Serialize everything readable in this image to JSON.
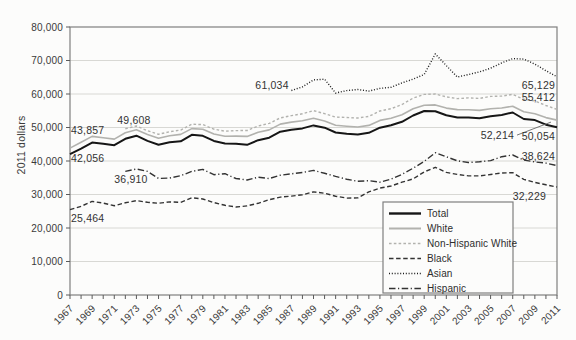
{
  "chart_data": {
    "type": "line",
    "title": "",
    "xlabel": "",
    "ylabel": "2011 dollars",
    "ylim": [
      0,
      80000
    ],
    "ytick_labels": [
      "0",
      "10,000",
      "20,000",
      "30,000",
      "40,000",
      "50,000",
      "60,000",
      "70,000",
      "80,000"
    ],
    "x": [
      1967,
      1968,
      1969,
      1970,
      1971,
      1972,
      1973,
      1974,
      1975,
      1976,
      1977,
      1978,
      1979,
      1980,
      1981,
      1982,
      1983,
      1984,
      1985,
      1986,
      1987,
      1988,
      1989,
      1990,
      1991,
      1992,
      1993,
      1994,
      1995,
      1996,
      1997,
      1998,
      1999,
      2000,
      2001,
      2002,
      2003,
      2004,
      2005,
      2006,
      2007,
      2008,
      2009,
      2010,
      2011
    ],
    "xtick_labels": [
      "1967",
      "1969",
      "1971",
      "1973",
      "1975",
      "1977",
      "1979",
      "1981",
      "1983",
      "1985",
      "1987",
      "1989",
      "1991",
      "1993",
      "1995",
      "1997",
      "1999",
      "2001",
      "2003",
      "2005",
      "2007",
      "2009",
      "2011"
    ],
    "grid": "horizontal",
    "grid_color": "#d8d8d4",
    "frame_color": "#7f7f7f",
    "tick_color": "#5a5a5a",
    "legend_position": "inside-bottom-right",
    "series": [
      {
        "name": "Total",
        "color": "#161616",
        "width": 2,
        "dash": "",
        "values": [
          42056,
          43700,
          45499,
          45146,
          44707,
          46622,
          47563,
          45989,
          44851,
          45595,
          45884,
          47813,
          47527,
          45989,
          45260,
          45139,
          44823,
          46215,
          46945,
          48746,
          49358,
          49737,
          50624,
          49950,
          48516,
          48117,
          47884,
          48418,
          49935,
          50661,
          51704,
          53582,
          54932,
          54841,
          53646,
          53019,
          52973,
          52788,
          53371,
          53768,
          54489,
          52546,
          52195,
          50831,
          50054
        ]
      },
      {
        "name": "White",
        "color": "#b2b2ae",
        "width": 1.6,
        "dash": "",
        "values": [
          43857,
          45580,
          47340,
          46960,
          46550,
          48460,
          49310,
          47880,
          46780,
          47550,
          47930,
          49680,
          49500,
          48060,
          47370,
          47430,
          47330,
          48590,
          49290,
          51010,
          51620,
          52020,
          52790,
          51940,
          50700,
          50390,
          50150,
          50640,
          52130,
          52750,
          53780,
          55580,
          56650,
          56750,
          55780,
          55330,
          55270,
          55090,
          55600,
          55830,
          56350,
          54700,
          54100,
          52960,
          52214
        ]
      },
      {
        "name": "Non-Hispanic White",
        "color": "#b2b2ae",
        "width": 1.4,
        "dash": "2.6,2.2",
        "values": [
          null,
          null,
          null,
          null,
          null,
          49608,
          50450,
          49050,
          47970,
          48760,
          49230,
          51000,
          50880,
          49490,
          48890,
          49070,
          49090,
          50440,
          51230,
          52880,
          53560,
          54090,
          55040,
          54110,
          53090,
          52980,
          52850,
          53300,
          54920,
          55620,
          56870,
          58770,
          59870,
          60000,
          59120,
          58640,
          58850,
          58690,
          59280,
          59380,
          59880,
          58430,
          57900,
          56570,
          55412
        ]
      },
      {
        "name": "Black",
        "color": "#333333",
        "width": 1.4,
        "dash": "4.5,2.6",
        "values": [
          25464,
          26480,
          27930,
          27430,
          26660,
          27510,
          28170,
          27680,
          27370,
          27780,
          27660,
          29020,
          28670,
          27590,
          26790,
          26260,
          26610,
          27370,
          28440,
          29210,
          29520,
          29920,
          30770,
          30380,
          29480,
          28940,
          28990,
          30770,
          31900,
          32530,
          33660,
          34650,
          36760,
          38130,
          36590,
          35990,
          35540,
          35560,
          35960,
          36410,
          36510,
          34520,
          33600,
          32900,
          32229
        ]
      },
      {
        "name": "Asian",
        "color": "#1a1a1a",
        "width": 1.4,
        "dash": "1,1.8",
        "values": [
          null,
          null,
          null,
          null,
          null,
          null,
          null,
          null,
          null,
          null,
          null,
          null,
          null,
          null,
          null,
          null,
          null,
          null,
          null,
          null,
          61034,
          62130,
          64210,
          64410,
          60310,
          61020,
          61340,
          60880,
          61660,
          62010,
          63320,
          64460,
          65810,
          71980,
          68480,
          65060,
          65830,
          66600,
          67710,
          69280,
          70570,
          70430,
          68940,
          66970,
          65129
        ]
      },
      {
        "name": "Hispanic",
        "color": "#333333",
        "width": 1.4,
        "dash": "6.5,2.5,1.2,2.5",
        "values": [
          null,
          null,
          null,
          null,
          null,
          36910,
          37600,
          36890,
          34800,
          34900,
          35610,
          36900,
          37500,
          35920,
          36220,
          34770,
          34320,
          35170,
          34740,
          35770,
          36190,
          36570,
          37190,
          36320,
          35410,
          34580,
          33930,
          34130,
          33680,
          34590,
          36010,
          37840,
          39870,
          42470,
          41240,
          40070,
          39540,
          39750,
          40120,
          41280,
          41780,
          40270,
          39730,
          39370,
          38624
        ]
      }
    ],
    "annotations": [
      {
        "text": "43,857",
        "series": "White",
        "year": 1967,
        "value": 43857,
        "dx": 1,
        "dy": -14,
        "anchor": "start"
      },
      {
        "text": "42,056",
        "series": "Total",
        "year": 1967,
        "value": 42056,
        "dx": 1,
        "dy": 8,
        "anchor": "start"
      },
      {
        "text": "49,608",
        "series": "Non-Hispanic White",
        "year": 1972,
        "value": 49608,
        "dx": -8,
        "dy": -5,
        "anchor": "start"
      },
      {
        "text": "36,910",
        "series": "Hispanic",
        "year": 1972,
        "value": 36910,
        "dx": -11,
        "dy": 12,
        "anchor": "start"
      },
      {
        "text": "25,464",
        "series": "Black",
        "year": 1967,
        "value": 25464,
        "dx": 1,
        "dy": 12,
        "anchor": "start"
      },
      {
        "text": "61,034",
        "series": "Asian",
        "year": 1987,
        "value": 61034,
        "dx": -36,
        "dy": -2,
        "anchor": "start"
      },
      {
        "text": "65,129",
        "series": "Asian",
        "year": 2011,
        "value": 65129,
        "dx": -2,
        "dy": 12,
        "anchor": "end"
      },
      {
        "text": "55,412",
        "series": "Non-Hispanic White",
        "year": 2011,
        "value": 55412,
        "dx": -2,
        "dy": -8,
        "anchor": "end"
      },
      {
        "text": "52,214",
        "series": "White",
        "year": 2011,
        "value": 52214,
        "dx": -43,
        "dy": 19,
        "anchor": "end",
        "leader": true
      },
      {
        "text": "50,054",
        "series": "Total",
        "year": 2011,
        "value": 50054,
        "dx": -2,
        "dy": 13,
        "anchor": "end"
      },
      {
        "text": "38,624",
        "series": "Hispanic",
        "year": 2011,
        "value": 38624,
        "dx": -2,
        "dy": -6,
        "anchor": "end"
      },
      {
        "text": "32,229",
        "series": "Black",
        "year": 2011,
        "value": 32229,
        "dx": -11,
        "dy": 13,
        "anchor": "end"
      }
    ]
  }
}
